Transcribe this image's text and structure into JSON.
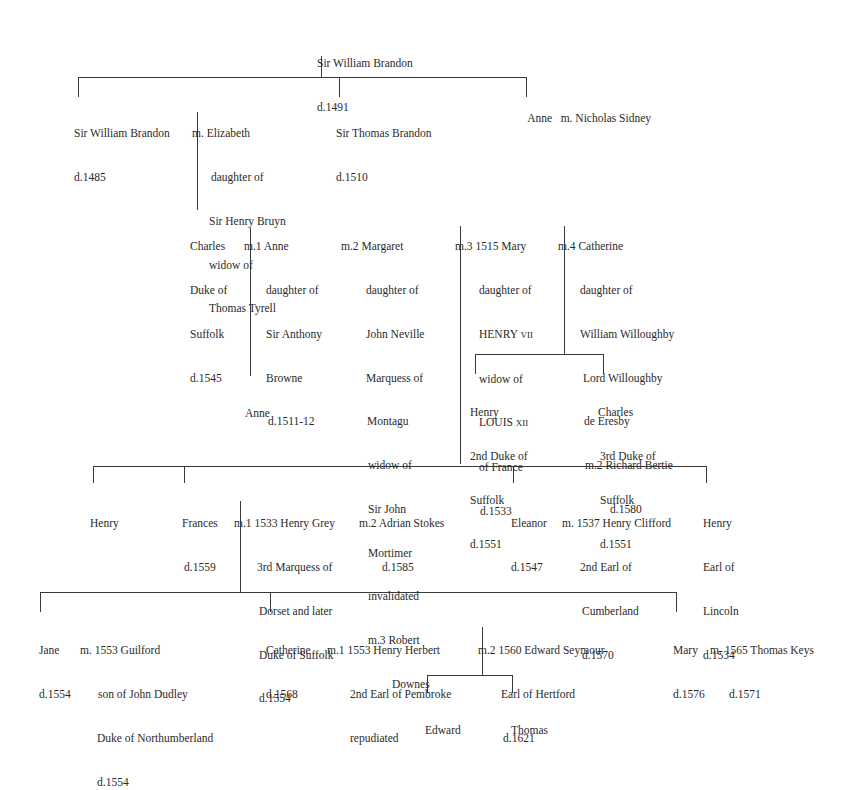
{
  "generation_1": {
    "root": {
      "name": "Sir William Brandon",
      "died": "d.1491"
    }
  },
  "generation_2": {
    "william": {
      "name": "Sir William Brandon",
      "died": "d.1485"
    },
    "william_spouse": {
      "line1": "m. Elizabeth",
      "line2": "daughter of",
      "line3": "Sir Henry Bruyn",
      "line4": "widow of",
      "line5": "Thomas Tyrell"
    },
    "thomas": {
      "name": "Sir Thomas Brandon",
      "died": "d.1510"
    },
    "anne": {
      "name": "Anne",
      "spouse": "m. Nicholas Sidney"
    }
  },
  "generation_3": {
    "charles": {
      "line1": "Charles",
      "line2": "Duke of",
      "line3": "Suffolk",
      "line4": "d.1545"
    },
    "m1": {
      "line1": "m.1 Anne",
      "line2": "daughter of",
      "line3": "Sir Anthony",
      "line4": "Browne",
      "line5": "d.1511-12"
    },
    "m2": {
      "line1": "m.2 Margaret",
      "line2": "daughter of",
      "line3": "John Neville",
      "line4": "Marquess of",
      "line5": "Montagu",
      "line6": "widow of",
      "line7": "Sir John",
      "line8": "Mortimer",
      "line9": "invalidated",
      "line10": "m.3 Robert",
      "line11": "Downes"
    },
    "m3": {
      "line1": "m.3 1515 Mary",
      "line2": "daughter of",
      "line3a": "HENRY ",
      "line3b": "VII",
      "line4": "widow of",
      "line5a": "LOUIS ",
      "line5b": "XII",
      "line6": "of France",
      "line7": "d.1533"
    },
    "m4": {
      "line1": "m.4 Catherine",
      "line2": "daughter of",
      "line3": "William Willoughby",
      "line4": "Lord Willoughby",
      "line5": "de Eresby",
      "line6": "m.2 Richard Bertie",
      "line7": "d.1580"
    }
  },
  "generation_4": {
    "anne_child": {
      "name": "Anne"
    },
    "henry_2nd": {
      "line1": "Henry",
      "line2": "2nd Duke of",
      "line3": "Suffolk",
      "line4": "d.1551"
    },
    "charles_3rd": {
      "line1": "Charles",
      "line2": "3rd Duke of",
      "line3": "Suffolk",
      "line4": "d.1551"
    },
    "henry": {
      "name": "Henry"
    },
    "frances": {
      "name": "Frances",
      "died": "d.1559"
    },
    "frances_m1": {
      "line1": "m.1 1533 Henry Grey",
      "line2": "3rd Marquess of",
      "line3": "Dorset and later",
      "line4": "Duke of Suffolk",
      "line5": "d.1554"
    },
    "frances_m2": {
      "line1": "m.2 Adrian Stokes",
      "line2": "d.1585"
    },
    "eleanor": {
      "name": "Eleanor",
      "died": "d.1547"
    },
    "eleanor_m": {
      "line1": "m. 1537 Henry Clifford",
      "line2": "2nd Earl of",
      "line3": "Cumberland",
      "line4": "d.1570"
    },
    "henry_lincoln": {
      "line1": "Henry",
      "line2": "Earl of",
      "line3": "Lincoln",
      "line4": "d.1534"
    }
  },
  "generation_5": {
    "jane": {
      "name": "Jane",
      "died": "d.1554"
    },
    "jane_m": {
      "line1": "m. 1553 Guilford",
      "line2": "son of John Dudley",
      "line3": "Duke of Northumberland",
      "line4": "d.1554"
    },
    "catherine": {
      "name": "Catherine",
      "died": "d.1568"
    },
    "catherine_m1": {
      "line1": "m.1 1553 Henry Herbert",
      "line2": "2nd Earl of Pembroke",
      "line3": "repudiated"
    },
    "catherine_m2": {
      "line1": "m.2 1560 Edward Seymour",
      "line2": "Earl of Hertford",
      "line3": "d.1621"
    },
    "mary": {
      "name": "Mary",
      "died": "d.1576"
    },
    "mary_m": {
      "line1": "m. 1565 Thomas Keys",
      "line2": "d.1571"
    }
  },
  "generation_6": {
    "edward": {
      "name": "Edward"
    },
    "thomas": {
      "name": "Thomas"
    }
  }
}
